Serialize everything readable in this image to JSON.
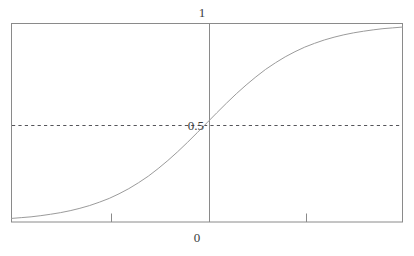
{
  "figure": {
    "name": "sigmoid-logistic-curve-plot",
    "background_color": "#ffffff",
    "frame_color": "#8a8a8a",
    "curve_color": "#9b9b9b",
    "axis_color": "#8a8a8a",
    "dashed_line_color": "#5a5a5a",
    "label_color": "#3b3b3b"
  },
  "labels": {
    "top": "1",
    "middle": "0.5",
    "bottom": "0"
  },
  "chart_data": {
    "type": "line",
    "title": "",
    "xlabel": "",
    "ylabel": "",
    "xlim": [
      -4,
      4
    ],
    "ylim": [
      0,
      1
    ],
    "grid": false,
    "legend": "none",
    "x_tick_labels": [
      "",
      "0",
      ""
    ],
    "x_ticks": [
      -2,
      0,
      2
    ],
    "y_tick_labels": [
      "1",
      "0.5"
    ],
    "y_ticks": [
      1,
      0.5
    ],
    "annotations": [
      {
        "text": "1",
        "x": 0,
        "y": 1,
        "position": "above-axis-top"
      },
      {
        "text": "0.5",
        "x": 0,
        "y": 0.5,
        "position": "left-of-axis"
      },
      {
        "text": "0",
        "x": 0,
        "y": 0,
        "position": "below-axis-bottom"
      }
    ],
    "reference_lines": [
      {
        "orientation": "horizontal",
        "value": 0.5,
        "style": "dashed"
      },
      {
        "orientation": "vertical",
        "value": 0,
        "style": "solid"
      }
    ],
    "series": [
      {
        "name": "logistic",
        "function": "1 / (1 + exp(-x))",
        "x": [
          -4.0,
          -3.8,
          -3.6,
          -3.4,
          -3.2,
          -3.0,
          -2.8,
          -2.6,
          -2.4,
          -2.2,
          -2.0,
          -1.8,
          -1.6,
          -1.4,
          -1.2,
          -1.0,
          -0.8,
          -0.6,
          -0.4,
          -0.2,
          0.0,
          0.2,
          0.4,
          0.6,
          0.8,
          1.0,
          1.2,
          1.4,
          1.6,
          1.8,
          2.0,
          2.2,
          2.4,
          2.6,
          2.8,
          3.0,
          3.2,
          3.4,
          3.6,
          3.8,
          4.0
        ],
        "values": [
          0.018,
          0.022,
          0.026,
          0.032,
          0.039,
          0.047,
          0.057,
          0.069,
          0.083,
          0.1,
          0.119,
          0.142,
          0.168,
          0.198,
          0.231,
          0.269,
          0.31,
          0.354,
          0.401,
          0.45,
          0.5,
          0.55,
          0.599,
          0.646,
          0.69,
          0.731,
          0.769,
          0.802,
          0.832,
          0.858,
          0.881,
          0.9,
          0.917,
          0.931,
          0.943,
          0.953,
          0.961,
          0.968,
          0.974,
          0.978,
          0.982
        ]
      }
    ]
  }
}
